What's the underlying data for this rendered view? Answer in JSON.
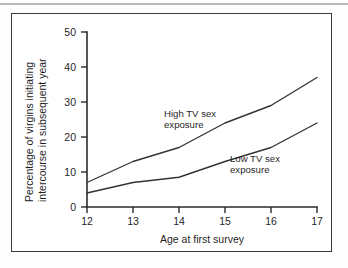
{
  "figure": {
    "border_color": "#3a3a3a",
    "background": "#ffffff"
  },
  "chart_data": {
    "type": "line",
    "title": "",
    "xlabel": "Age at first survey",
    "ylabel": "Percentage of virgins initiating intercourse in subsequent year",
    "ylabel_line1": "Percentage of virgins initiating",
    "ylabel_line2": "intercourse in subsequent year",
    "x": [
      12,
      13,
      14,
      15,
      16,
      17
    ],
    "xticks": [
      "12",
      "13",
      "14",
      "15",
      "16",
      "17"
    ],
    "yticks": [
      "0",
      "10",
      "20",
      "30",
      "40",
      "50"
    ],
    "xlim": [
      12,
      17
    ],
    "ylim": [
      0,
      50
    ],
    "grid": false,
    "legend_position": "inline-annotations",
    "series": [
      {
        "name": "High TV sex exposure",
        "values": [
          7,
          13,
          17,
          24,
          29,
          37
        ],
        "annotation": "High TV sex exposure",
        "annotation_line1": "High TV sex",
        "annotation_line2": "exposure",
        "color": "#333333"
      },
      {
        "name": "Low TV sex exposure",
        "values": [
          4,
          7,
          8.5,
          13,
          17,
          24
        ],
        "annotation": "Low TV sex exposure",
        "annotation_line1": "Low TV sex",
        "annotation_line2": "exposure",
        "color": "#333333"
      }
    ]
  }
}
